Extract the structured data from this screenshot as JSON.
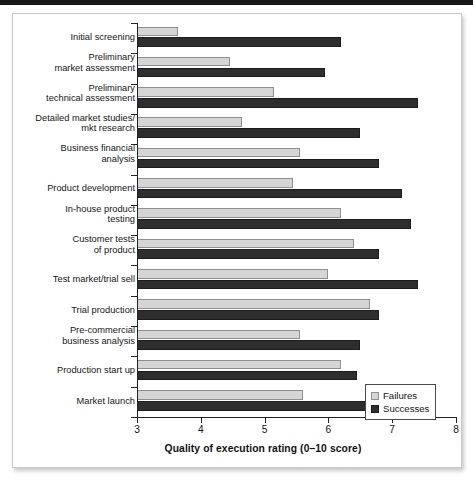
{
  "figure": {
    "axis_title": "Quality of execution rating (0–10 score)",
    "legend": {
      "failures_label": "Failures",
      "successes_label": "Successes"
    },
    "colors": {
      "failures": "#d5d5d5",
      "successes": "#2e2e2e",
      "axis": "#222222",
      "text": "#121212"
    }
  },
  "chart_data": {
    "type": "bar",
    "orientation": "horizontal",
    "title": "",
    "xlabel": "Quality of execution rating (0–10 score)",
    "ylabel": "",
    "xlim": [
      3,
      8
    ],
    "xticks": [
      3,
      4,
      5,
      6,
      7,
      8
    ],
    "xtick_labels": [
      "3",
      "4",
      "5",
      "6",
      "7",
      "8"
    ],
    "grid": false,
    "legend_position": "bottom-right",
    "categories": [
      "Initial screening",
      "Preliminary\nmarket assessment",
      "Preliminary\ntechnical assessment",
      "Detailed market studies/\nmkt research",
      "Business financial\nanalysis",
      "Product development",
      "In-house product\ntesting",
      "Customer tests\nof product",
      "Test market/trial sell",
      "Trial production",
      "Pre-commercial\nbusiness analysis",
      "Production start up",
      "Market launch"
    ],
    "series": [
      {
        "name": "Failures",
        "color": "#d5d5d5",
        "values": [
          3.65,
          4.45,
          5.15,
          4.65,
          5.55,
          5.45,
          6.2,
          6.4,
          6.0,
          6.65,
          5.55,
          6.2,
          5.6
        ]
      },
      {
        "name": "Successes",
        "color": "#2e2e2e",
        "values": [
          6.2,
          5.95,
          7.4,
          6.5,
          6.8,
          7.15,
          7.3,
          6.8,
          7.4,
          6.8,
          6.5,
          6.45,
          6.7
        ]
      }
    ]
  }
}
